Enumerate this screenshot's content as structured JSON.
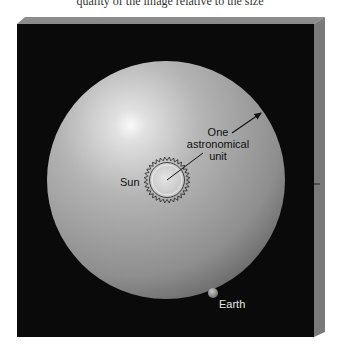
{
  "caption_fragment": "quality of the image relative to the size",
  "diagram": {
    "labels": {
      "sun": "Sun",
      "au_line1": "One",
      "au_line2": "astronomical",
      "au_line3": "unit",
      "earth": "Earth"
    },
    "colors": {
      "background_box": "#0a0a0a",
      "box_side": "#7a7a7a",
      "box_top": "#8c8c8c",
      "sphere_light": "#f2f2f2",
      "sphere_mid": "#a8a8a8",
      "sphere_dark": "#5a5a5a",
      "earth_label": "#e6e6e6",
      "text_dark": "#111111"
    }
  }
}
